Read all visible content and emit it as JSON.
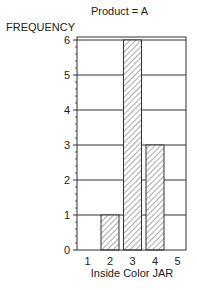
{
  "chart_data": {
    "type": "bar",
    "title": "Product = A",
    "xlabel": "Inside Color JAR",
    "ylabel": "FREQUENCY",
    "categories": [
      "1",
      "2",
      "3",
      "4",
      "5"
    ],
    "values": [
      0,
      1,
      6,
      3,
      0
    ],
    "ylim": [
      0,
      6
    ],
    "yticks": [
      "0",
      "1",
      "2",
      "3",
      "4",
      "5",
      "6"
    ],
    "grid": true,
    "bar_fill": "hatched",
    "legend": null
  },
  "colors": {
    "axis": "#333333",
    "grid": "#333333",
    "hatch": "#555555",
    "background": "#ffffff"
  }
}
